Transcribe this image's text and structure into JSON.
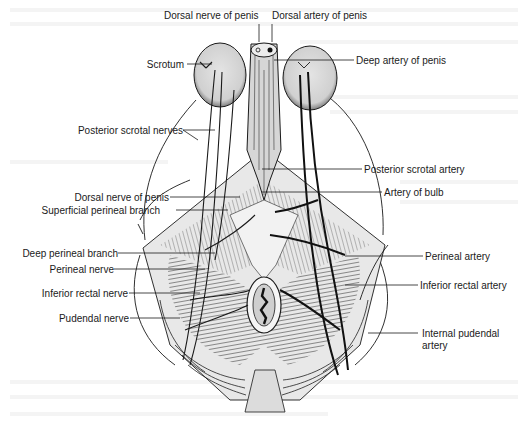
{
  "figure": {
    "colors": {
      "background": "#ffffff",
      "line": "#1a1a1a",
      "tissue_fill": "#e6e6e6",
      "muscle_fill": "#bdbdbd",
      "bleed_text": "#f2f2f2"
    }
  },
  "labels": {
    "top": {
      "dorsal_nerve_of_penis": "Dorsal nerve of penis",
      "dorsal_artery_of_penis": "Dorsal artery of penis"
    },
    "left": [
      {
        "id": "scrotum",
        "text": "Scrotum"
      },
      {
        "id": "posterior-scrotal-nerves",
        "text": "Posterior scrotal nerves"
      },
      {
        "id": "dorsal-nerve-of-penis-2",
        "text": "Dorsal nerve of penis"
      },
      {
        "id": "superficial-perineal-branch",
        "text": "Superficial perineal branch"
      },
      {
        "id": "deep-perineal-branch",
        "text": "Deep perineal branch"
      },
      {
        "id": "perineal-nerve",
        "text": "Perineal nerve"
      },
      {
        "id": "inferior-rectal-nerve",
        "text": "Inferior rectal nerve"
      },
      {
        "id": "pudendal-nerve",
        "text": "Pudendal nerve"
      }
    ],
    "right": [
      {
        "id": "deep-artery-of-penis",
        "text": "Deep artery of penis"
      },
      {
        "id": "posterior-scrotal-artery",
        "text": "Posterior scrotal artery"
      },
      {
        "id": "artery-of-bulb",
        "text": "Artery of bulb"
      },
      {
        "id": "perineal-artery",
        "text": "Perineal artery"
      },
      {
        "id": "inferior-rectal-artery",
        "text": "Inferior rectal artery"
      },
      {
        "id": "internal-pudendal-artery-1",
        "text": "Internal pudendal"
      },
      {
        "id": "internal-pudendal-artery-2",
        "text": "artery"
      }
    ]
  }
}
